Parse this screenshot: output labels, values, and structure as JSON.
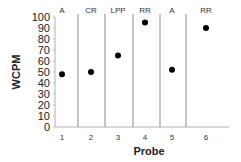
{
  "chart_data": {
    "type": "scatter",
    "title": "",
    "xlabel": "Probe",
    "ylabel": "WCPM",
    "ylim": [
      0,
      100
    ],
    "yticks": [
      0,
      10,
      20,
      30,
      40,
      50,
      60,
      70,
      80,
      90,
      100
    ],
    "categories": [
      "1",
      "2",
      "3",
      "4",
      "5",
      "6"
    ],
    "series": [
      {
        "name": "WCPM",
        "values": [
          48,
          50,
          65,
          95,
          52,
          90
        ],
        "marker": "circle",
        "color": "#000000"
      }
    ],
    "phases": [
      {
        "label": "A",
        "probes": [
          1
        ]
      },
      {
        "label": "CR",
        "probes": [
          2
        ]
      },
      {
        "label": "LPP",
        "probes": [
          3
        ]
      },
      {
        "label": "RR",
        "probes": [
          4
        ]
      },
      {
        "label": "A",
        "probes": [
          5
        ]
      },
      {
        "label": "RR",
        "probes": [
          6
        ]
      }
    ],
    "phase_dividers_between": [
      [
        1,
        2
      ],
      [
        2,
        3
      ],
      [
        3,
        4
      ],
      [
        4,
        5
      ],
      [
        5,
        6
      ]
    ],
    "grid": false,
    "legend": null
  },
  "colors": {
    "axis": "#b0b0b0",
    "divider": "#8a8a8a",
    "marker": "#000000"
  }
}
